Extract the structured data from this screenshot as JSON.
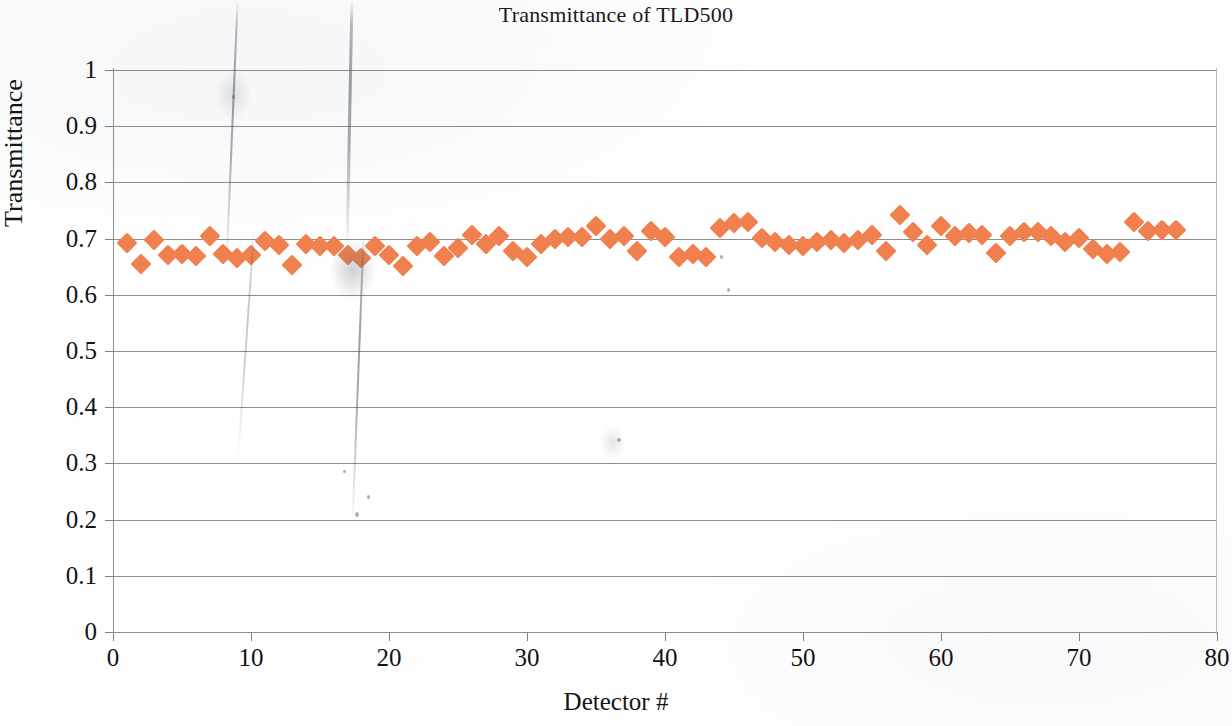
{
  "chart_data": {
    "type": "scatter",
    "title": "Transmittance of TLD500",
    "xlabel": "Detector #",
    "ylabel": "Transmittance",
    "xlim": [
      0,
      80
    ],
    "ylim": [
      0,
      1
    ],
    "xticks": [
      0,
      10,
      20,
      30,
      40,
      50,
      60,
      70,
      80
    ],
    "yticks": [
      0,
      0.1,
      0.2,
      0.3,
      0.4,
      0.5,
      0.6,
      0.7,
      0.8,
      0.9,
      1
    ],
    "xtick_labels": [
      "0",
      "10",
      "20",
      "30",
      "40",
      "50",
      "60",
      "70",
      "80"
    ],
    "ytick_labels": [
      "0",
      "0.1",
      "0.2",
      "0.3",
      "0.4",
      "0.5",
      "0.6",
      "0.7",
      "0.8",
      "0.9",
      "1"
    ],
    "grid": "horizontal",
    "legend": "none",
    "marker": "diamond",
    "marker_color": "#F0814F",
    "series": [
      {
        "name": "Transmittance",
        "x": [
          1,
          2,
          3,
          4,
          5,
          6,
          7,
          8,
          9,
          10,
          11,
          12,
          13,
          14,
          15,
          16,
          17,
          18,
          19,
          20,
          21,
          22,
          23,
          24,
          25,
          26,
          27,
          28,
          29,
          30,
          31,
          32,
          33,
          34,
          35,
          36,
          37,
          38,
          39,
          40,
          41,
          42,
          43,
          44,
          45,
          46,
          47,
          48,
          49,
          50,
          51,
          52,
          53,
          54,
          55,
          56,
          57,
          58,
          59,
          60,
          61,
          62,
          63,
          64,
          65,
          66,
          67,
          68,
          69,
          70,
          71,
          72,
          73,
          74,
          75,
          76,
          77
        ],
        "y": [
          0.692,
          0.654,
          0.697,
          0.671,
          0.673,
          0.669,
          0.704,
          0.672,
          0.666,
          0.67,
          0.695,
          0.689,
          0.653,
          0.69,
          0.687,
          0.686,
          0.671,
          0.666,
          0.686,
          0.67,
          0.652,
          0.686,
          0.694,
          0.669,
          0.684,
          0.707,
          0.69,
          0.705,
          0.678,
          0.667,
          0.69,
          0.699,
          0.703,
          0.702,
          0.722,
          0.7,
          0.705,
          0.678,
          0.713,
          0.703,
          0.668,
          0.673,
          0.667,
          0.718,
          0.727,
          0.729,
          0.701,
          0.694,
          0.688,
          0.686,
          0.694,
          0.697,
          0.692,
          0.697,
          0.707,
          0.678,
          0.742,
          0.711,
          0.689,
          0.722,
          0.704,
          0.71,
          0.706,
          0.675,
          0.705,
          0.712,
          0.711,
          0.704,
          0.694,
          0.701,
          0.681,
          0.672,
          0.677,
          0.729,
          0.713,
          0.715,
          0.715
        ]
      }
    ]
  }
}
